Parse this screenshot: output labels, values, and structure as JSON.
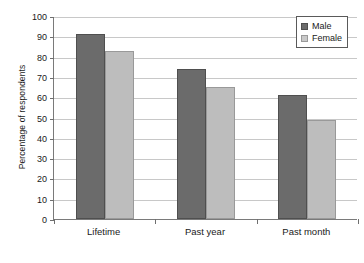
{
  "chart_data": {
    "type": "bar",
    "title": "",
    "subtitle": "",
    "xlabel": "",
    "ylabel": "Percentage of respondents",
    "categories": [
      "Lifetime",
      "Past year",
      "Past month"
    ],
    "series": [
      {
        "name": "Male",
        "values": [
          91,
          74,
          61
        ],
        "color": "#6b6b6b"
      },
      {
        "name": "Female",
        "values": [
          83,
          65,
          49
        ],
        "color": "#bdbdbd"
      }
    ],
    "ylim": [
      0,
      100
    ],
    "ytick_step": 10,
    "yticks": [
      0,
      10,
      20,
      30,
      40,
      50,
      60,
      70,
      80,
      90,
      100
    ],
    "ytick_labels": [
      "0",
      "10",
      "20",
      "30",
      "40",
      "50",
      "60",
      "70",
      "80",
      "90",
      "100"
    ],
    "grid": true,
    "grid_axis": "y",
    "legend_position": "top-right",
    "legend_entries": [
      "Male",
      "Female"
    ],
    "background_color": "#ffffff",
    "gridline_color": "#c8c8c8",
    "axis_color": "#7a7a7a"
  }
}
